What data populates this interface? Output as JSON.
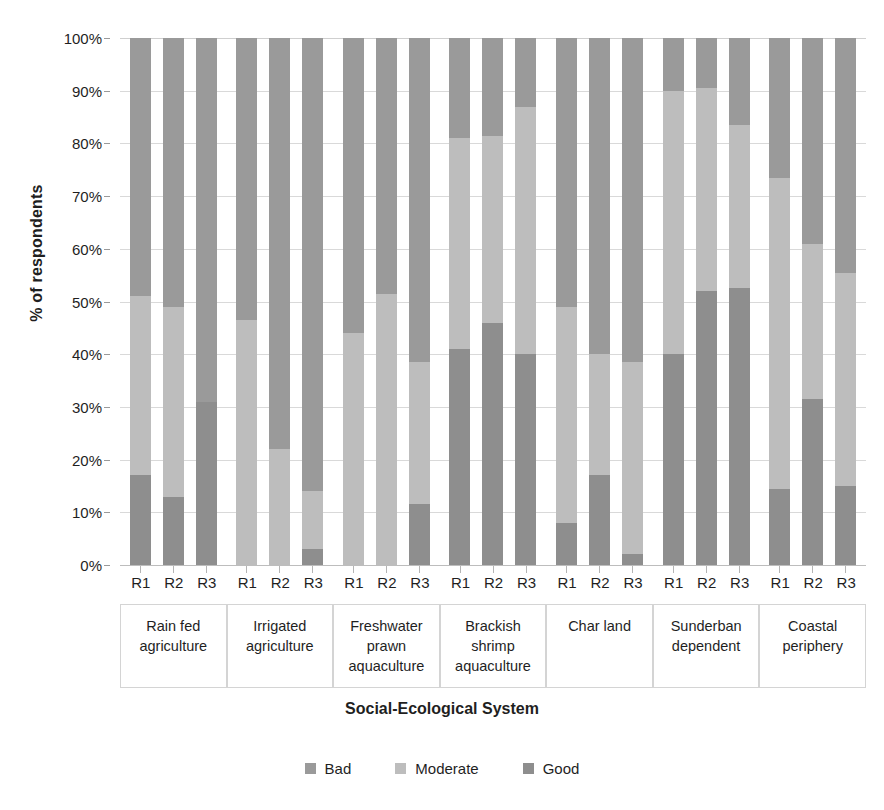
{
  "chart_data": {
    "type": "bar",
    "subtype": "stacked-100-percent",
    "title": "",
    "xlabel": "Social-Ecological System",
    "ylabel": "% of respondents",
    "ylim": [
      0,
      100
    ],
    "ytick_labels": [
      "0%",
      "10%",
      "20%",
      "30%",
      "40%",
      "50%",
      "60%",
      "70%",
      "80%",
      "90%",
      "100%"
    ],
    "ytick_values": [
      0,
      10,
      20,
      30,
      40,
      50,
      60,
      70,
      80,
      90,
      100
    ],
    "grid": true,
    "legend_position": "bottom",
    "legend": [
      "Bad",
      "Moderate",
      "Good"
    ],
    "series_colors": {
      "Bad": "#9a9a9a",
      "Moderate": "#bdbdbd",
      "Good": "#8e8e8e"
    },
    "categories": [
      "Rain fed agriculture",
      "Irrigated agriculture",
      "Freshwater prawn aquaculture",
      "Brackish shrimp aquaculture",
      "Char land",
      "Sunderban dependent",
      "Coastal periphery"
    ],
    "subcategories": [
      "R1",
      "R2",
      "R3"
    ],
    "series": [
      {
        "name": "Good",
        "values": [
          [
            17,
            13,
            31
          ],
          [
            0,
            0,
            3
          ],
          [
            0,
            0,
            11.5
          ],
          [
            41,
            46,
            40
          ],
          [
            8,
            17,
            2
          ],
          [
            40,
            52,
            52.5
          ],
          [
            14.5,
            31.5,
            15
          ]
        ]
      },
      {
        "name": "Moderate",
        "values": [
          [
            34,
            36,
            0
          ],
          [
            46.5,
            22,
            11
          ],
          [
            44,
            51.5,
            27
          ],
          [
            40,
            35.5,
            47
          ],
          [
            41,
            23,
            36.5
          ],
          [
            50,
            38.5,
            31
          ],
          [
            59,
            29.5,
            40.5
          ]
        ]
      },
      {
        "name": "Bad",
        "values": [
          [
            49,
            51,
            69
          ],
          [
            53.5,
            78,
            86
          ],
          [
            56,
            48.5,
            61.5
          ],
          [
            19,
            18.5,
            13
          ],
          [
            51,
            60,
            61.5
          ],
          [
            10,
            9.5,
            16.5
          ],
          [
            26.5,
            39,
            44.5
          ]
        ]
      }
    ],
    "stack_order_bottom_to_top": [
      "Good",
      "Moderate",
      "Bad"
    ],
    "cumulative_tops": {
      "note": "Top of Moderate segment (= 100 - Bad) per bar",
      "values": [
        [
          51,
          49,
          31
        ],
        [
          46.5,
          22,
          14
        ],
        [
          44,
          51.5,
          38.5
        ],
        [
          81,
          81.5,
          87
        ],
        [
          49,
          40,
          38.5
        ],
        [
          90,
          90.5,
          83.5
        ],
        [
          73.5,
          61,
          55.5
        ]
      ]
    }
  },
  "category_labels_wrapped": [
    [
      "Rain fed",
      "agriculture"
    ],
    [
      "Irrigated",
      "agriculture"
    ],
    [
      "Freshwater",
      "prawn",
      "aquaculture"
    ],
    [
      "Brackish",
      "shrimp",
      "aquaculture"
    ],
    [
      "Char land"
    ],
    [
      "Sunderban",
      "dependent"
    ],
    [
      "Coastal",
      "periphery"
    ]
  ]
}
